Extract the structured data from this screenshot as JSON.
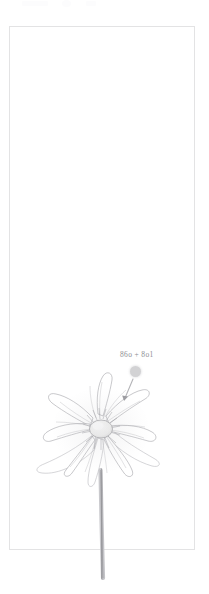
{
  "canvas": {
    "width": 209,
    "height": 594,
    "background": "#ffffff"
  },
  "frame": {
    "border_color": "#e3e3e4",
    "fill": "#ffffff",
    "x": 9,
    "y": 26,
    "width": 186,
    "height": 524
  },
  "artwork": {
    "subject": "anemone-flower-pencil-sketch",
    "style": "graphite pencil drawing",
    "ink_color": "#9a9a9e",
    "petal_fill": "#fdfdfd",
    "stem_color": "#a9a9ad",
    "center_color": "#f3f3f2"
  },
  "annotation": {
    "label": "86o + 8o1",
    "label_color": "#8e8e93",
    "dot_color": "#d2d2d4",
    "leader_color": "#b4b4b8",
    "dot": {
      "cx": 135.5,
      "cy": 371.5,
      "r": 5.5
    },
    "leader": {
      "x1": 132,
      "y1": 379,
      "x2": 124,
      "y2": 400
    },
    "arrow_tip": {
      "x": 124,
      "y": 400
    }
  },
  "top_strip": {
    "note": "faint cropped ui remnants",
    "ghosts": 3
  }
}
